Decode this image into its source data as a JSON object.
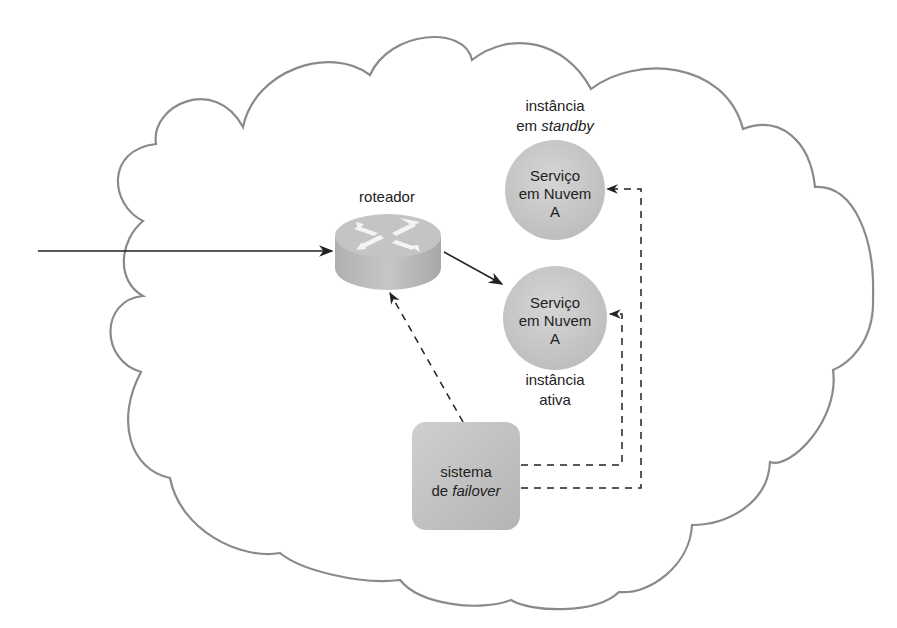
{
  "diagram": {
    "title": "",
    "colors": {
      "cloud_stroke": "#8a8a8a",
      "node_fill": "#c8c8c8",
      "arrow": "#222222",
      "text": "#222222",
      "router_fill": "#bdbdbd",
      "router_icon": "#f2f2f2"
    },
    "nodes": {
      "router": {
        "label": "roteador",
        "icon": "router-icon"
      },
      "standby_service": {
        "line1": "Serviço",
        "line2": "em Nuvem",
        "line3": "A",
        "caption_line1": "instância",
        "caption_line2_prefix": "em ",
        "caption_line2_italic": "standby"
      },
      "active_service": {
        "line1": "Serviço",
        "line2": "em Nuvem",
        "line3": "A",
        "caption_line1": "instância",
        "caption_line2": "ativa"
      },
      "failover_system": {
        "line1": "sistema",
        "line2_prefix": "de ",
        "line2_italic": "failover"
      }
    },
    "edges": [
      {
        "from": "external",
        "to": "router",
        "style": "solid"
      },
      {
        "from": "router",
        "to": "active_service",
        "style": "solid"
      },
      {
        "from": "failover_system",
        "to": "router",
        "style": "dashed"
      },
      {
        "from": "failover_system",
        "to": "active_service",
        "style": "dashed"
      },
      {
        "from": "failover_system",
        "to": "standby_service",
        "style": "dashed"
      }
    ],
    "container": {
      "shape": "cloud"
    }
  }
}
